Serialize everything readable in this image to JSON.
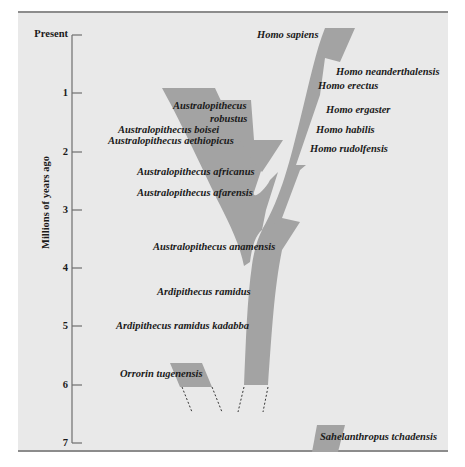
{
  "axis": {
    "title": "Millions of years ago",
    "ticks": [
      {
        "label": "Present",
        "y": 35
      },
      {
        "label": "1",
        "y": 93
      },
      {
        "label": "2",
        "y": 152
      },
      {
        "label": "3",
        "y": 210
      },
      {
        "label": "4",
        "y": 268
      },
      {
        "label": "5",
        "y": 326
      },
      {
        "label": "6",
        "y": 385
      },
      {
        "label": "7",
        "y": 443
      }
    ]
  },
  "colors": {
    "panel_bg": "#e9e9e9",
    "branch_fill": "#a3a3a3",
    "border": "#8c8c8c",
    "text": "#1a1a1a"
  },
  "species": {
    "homo_sapiens": "Homo sapiens",
    "homo_neanderthalensis": "Homo neanderthalensis",
    "homo_erectus": "Homo erectus",
    "homo_ergaster": "Homo ergaster",
    "homo_habilis": "Homo habilis",
    "homo_rudolfensis": "Homo rudolfensis",
    "australopithecus_robustus_1": "Australopithecus",
    "australopithecus_robustus_2": "robustus",
    "australopithecus_boisei": "Australopithecus boisei",
    "australopithecus_aethiopicus": "Australopithecus aethiopicus",
    "australopithecus_africanus": "Australopithecus africanus",
    "australopithecus_afarensis": "Australopithecus afarensis",
    "australopithecus_anamensis": "Australopithecus anamensis",
    "ardipithecus_ramidus": "Ardipithecus ramidus",
    "ardipithecus_ramidus_kadabba": "Ardipithecus ramidus kadabba",
    "orrorin_tugenensis": "Orrorin tugenensis",
    "sahelanthropus_tchadensis": "Sahelanthropus tchadensis"
  }
}
